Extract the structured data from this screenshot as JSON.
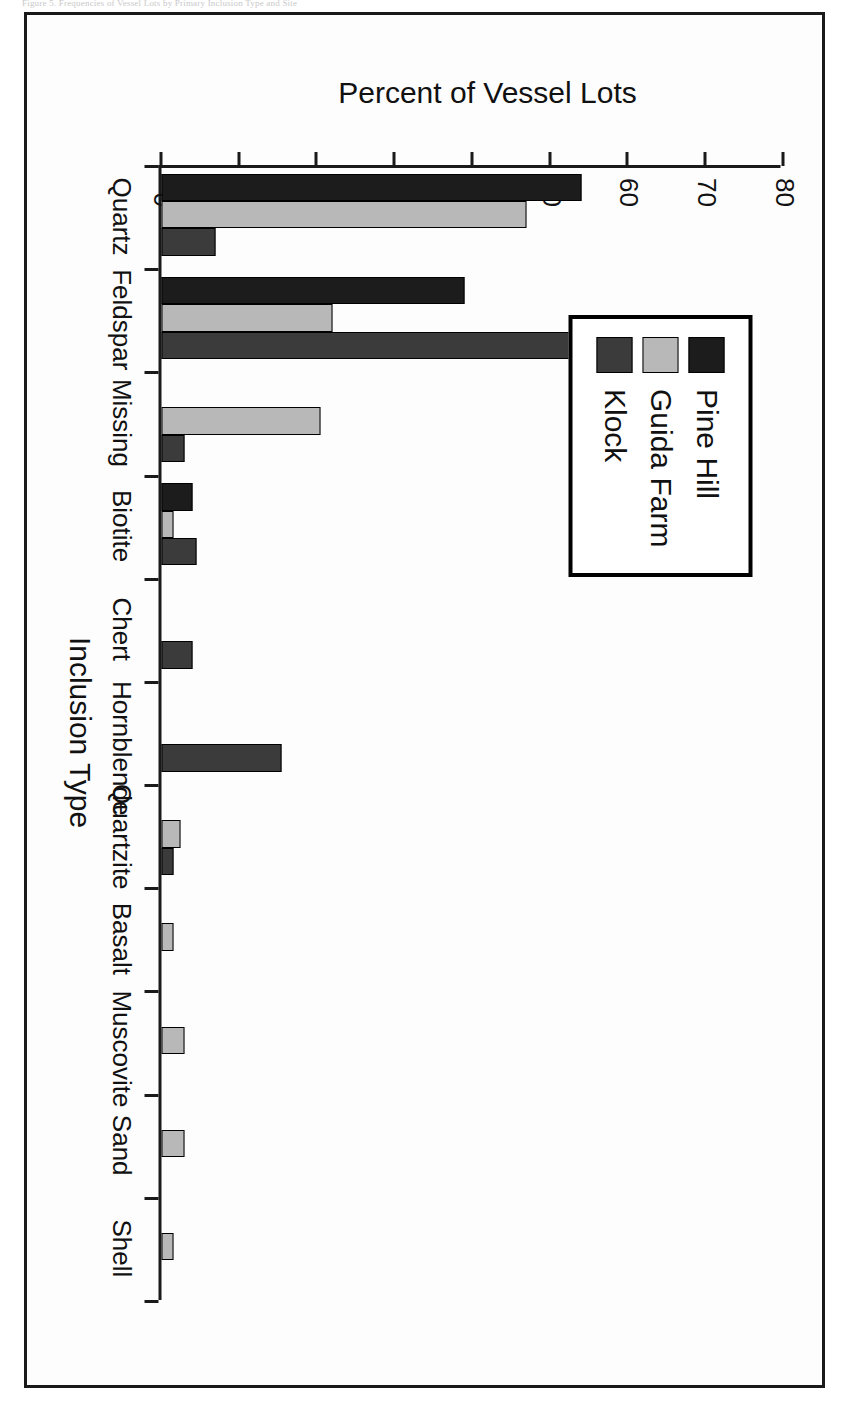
{
  "caption": "Figure 5. Frequencies of Vessel Lots by Primary Inclusion Type and Site",
  "chart_data": {
    "type": "bar",
    "title": "",
    "xlabel": "Inclusion Type",
    "ylabel": "Percent of Vessel Lots",
    "ylim": [
      0,
      80
    ],
    "yticks": [
      0,
      10,
      20,
      30,
      40,
      50,
      60,
      70,
      80
    ],
    "grid": false,
    "orientation": "vertical-bars-rotated-90",
    "legend_position": "upper-right-inside",
    "categories": [
      "Quartz",
      "Feldspar",
      "Missing",
      "Biotite",
      "Chert",
      "Hornblende",
      "Quartzite",
      "Basalt",
      "Muscovite",
      "Sand",
      "Shell"
    ],
    "series": [
      {
        "name": "Pine Hill",
        "color": "#1c1c1c",
        "values": [
          54,
          39,
          0,
          4,
          0,
          0,
          0,
          0,
          0,
          0,
          0
        ]
      },
      {
        "name": "Guida Farm",
        "color": "#b8b8b8",
        "values": [
          47,
          22,
          20.5,
          1.5,
          0,
          0,
          2.5,
          1.5,
          3,
          3,
          1.5
        ]
      },
      {
        "name": "Klock",
        "color": "#3b3b3b",
        "values": [
          7,
          75.5,
          3,
          4.5,
          4,
          15.5,
          1.5,
          0,
          0,
          0,
          0
        ]
      }
    ]
  },
  "legend": {
    "items": [
      {
        "label": "Pine Hill",
        "color": "#1c1c1c"
      },
      {
        "label": "Guida Farm",
        "color": "#b8b8b8"
      },
      {
        "label": "Klock",
        "color": "#3b3b3b"
      }
    ]
  }
}
